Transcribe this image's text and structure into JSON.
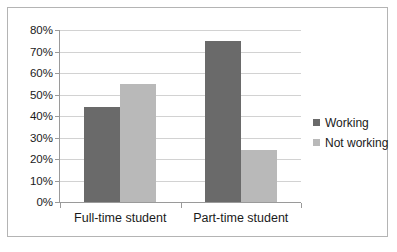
{
  "chart_data": {
    "type": "bar",
    "title": "",
    "subtitle": "",
    "xlabel": "",
    "ylabel": "",
    "categories": [
      "Full-time student",
      "Part-time student"
    ],
    "series": [
      {
        "name": "Working",
        "values": [
          44,
          75
        ],
        "color": "#6a6a6a"
      },
      {
        "name": "Not working",
        "values": [
          55,
          24
        ],
        "color": "#b9b9b9"
      }
    ],
    "ylim": [
      0,
      80
    ],
    "ytick_step": 10,
    "ytick_labels": [
      "0%",
      "10%",
      "20%",
      "30%",
      "40%",
      "50%",
      "60%",
      "70%",
      "80%"
    ],
    "ytick_values": [
      0,
      10,
      20,
      30,
      40,
      50,
      60,
      70,
      80
    ],
    "value_format": "percent",
    "grid": true,
    "grid_axis": "y",
    "legend_position": "right",
    "annotations": []
  },
  "colors": {
    "series_working": "#6a6a6a",
    "series_not_working": "#b9b9b9",
    "gridline": "#d2d2d2",
    "axis": "#9a9a9a",
    "frame_border": "#b4b4b4",
    "text": "#1a1a1a",
    "background": "#ffffff"
  }
}
